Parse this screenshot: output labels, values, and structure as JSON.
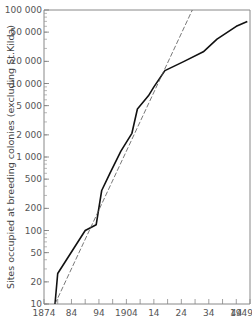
{
  "chart_data": {
    "type": "line",
    "title": "",
    "xlabel": "",
    "ylabel": "Sites occupied at breeding colonies (excluding St.Kilda)",
    "yscale": "log",
    "xlim": [
      1874,
      1949
    ],
    "ylim": [
      10,
      100000
    ],
    "grid": false,
    "legend": null,
    "x_tick_labels": [
      {
        "value": 1874,
        "label": "1874"
      },
      {
        "value": 1884,
        "label": "84"
      },
      {
        "value": 1894,
        "label": "94"
      },
      {
        "value": 1904,
        "label": "1904"
      },
      {
        "value": 1914,
        "label": "14"
      },
      {
        "value": 1924,
        "label": "24"
      },
      {
        "value": 1934,
        "label": "34"
      },
      {
        "value": 1944,
        "label": "44"
      },
      {
        "value": 1949,
        "label": "1949"
      }
    ],
    "y_tick_labels": [
      {
        "value": 10,
        "label": "10"
      },
      {
        "value": 20,
        "label": "20"
      },
      {
        "value": 50,
        "label": "50"
      },
      {
        "value": 100,
        "label": "100"
      },
      {
        "value": 200,
        "label": "200"
      },
      {
        "value": 500,
        "label": "500"
      },
      {
        "value": 1000,
        "label": "1 000"
      },
      {
        "value": 2000,
        "label": "2 000"
      },
      {
        "value": 5000,
        "label": "5 000"
      },
      {
        "value": 10000,
        "label": "10 000"
      },
      {
        "value": 20000,
        "label": "20 000"
      },
      {
        "value": 50000,
        "label": "50 000"
      },
      {
        "value": 100000,
        "label": "100 000"
      }
    ],
    "series": [
      {
        "name": "Observed sites",
        "style": "solid",
        "color": "#111111",
        "x": [
          1878,
          1879,
          1889,
          1893,
          1895,
          1898,
          1902,
          1906,
          1908,
          1912,
          1914,
          1918,
          1925,
          1932,
          1937,
          1944,
          1948
        ],
        "values": [
          10,
          26,
          100,
          120,
          350,
          600,
          1200,
          2100,
          4500,
          6800,
          9000,
          15000,
          20000,
          27000,
          40000,
          60000,
          70000
        ]
      },
      {
        "name": "Exponential trend",
        "style": "dashed",
        "color": "#555555",
        "x": [
          1878,
          1928
        ],
        "values": [
          10,
          100000
        ]
      }
    ]
  }
}
